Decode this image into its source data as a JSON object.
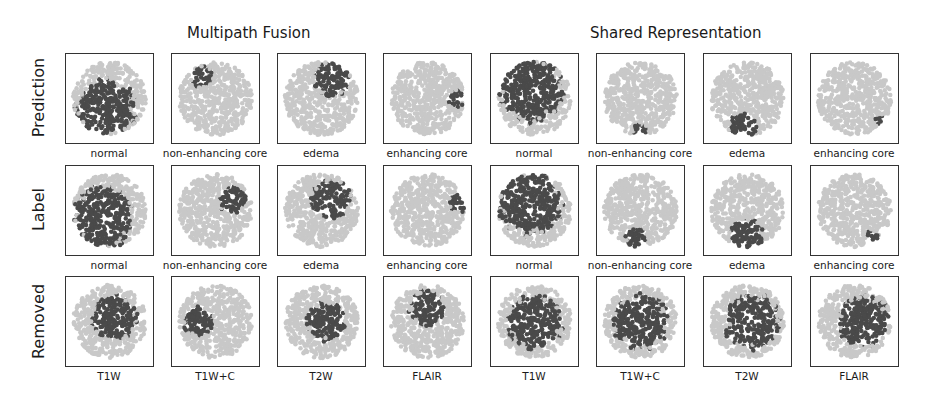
{
  "figure": {
    "groups": [
      {
        "title": "Multipath Fusion"
      },
      {
        "title": "Shared Representation"
      }
    ],
    "row_labels": [
      "Prediction",
      "Label",
      "Removed"
    ],
    "colors": {
      "background_points": "#c8c8c8",
      "highlight_points": "#4a4a4a",
      "frame": "#333333"
    },
    "panels": {
      "mf": {
        "prediction": [
          "normal",
          "non-enhancing core",
          "edema",
          "enhancing core"
        ],
        "label": [
          "normal",
          "non-enhancing core",
          "edema",
          "enhancing core"
        ],
        "removed": [
          "T1W",
          "T1W+C",
          "T2W",
          "FLAIR"
        ]
      },
      "sr": {
        "prediction": [
          "normal",
          "non-enhancing core",
          "edema",
          "enhancing core"
        ],
        "label": [
          "normal",
          "non-enhancing core",
          "edema",
          "enhancing core"
        ],
        "removed": [
          "T1W",
          "T1W+C",
          "T2W",
          "FLAIR"
        ]
      }
    }
  }
}
